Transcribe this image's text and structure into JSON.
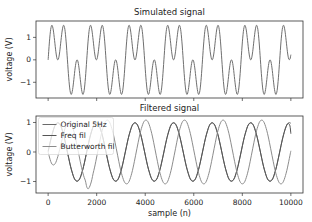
{
  "figure": {
    "ylabel_top": "voltage (V)",
    "ylabel_bottom": "voltage (V)",
    "xlabel": "sample (n)"
  },
  "chart_data": [
    {
      "type": "line",
      "title": "Simulated signal",
      "xlabel": "",
      "ylabel": "voltage (V)",
      "xlim": [
        -500,
        10500
      ],
      "ylim": [
        -1.7,
        1.73
      ],
      "xticks": [
        0,
        2000,
        4000,
        6000,
        8000,
        10000
      ],
      "xtick_labels_visible": false,
      "yticks": [
        -1,
        0,
        1
      ],
      "ytick_labels": [
        "−1",
        "0",
        "1"
      ],
      "grid": false,
      "legend": null,
      "x_start": 0,
      "x_step": 53,
      "x_end": 10000,
      "series": [
        {
          "name": "Simulated signal",
          "color": "#6f6f6f",
          "values": [
            0.0,
            0.8,
            1.36,
            1.54,
            1.33,
            0.87,
            0.36,
            0.04,
            0.04,
            0.36,
            0.87,
            1.33,
            1.54,
            1.36,
            0.8,
            0.0,
            -0.8,
            -1.36,
            -1.54,
            -1.33,
            -0.87,
            -0.36,
            -0.04,
            -0.04,
            -0.36,
            -0.87,
            -1.33,
            -1.54,
            -1.36,
            -0.8,
            0.0,
            0.8,
            1.36,
            1.54,
            1.33,
            0.87,
            0.36,
            0.04,
            0.04,
            0.36,
            0.87,
            1.33,
            1.54,
            1.36,
            0.8,
            0.0,
            -0.8,
            -1.36,
            -1.54,
            -1.33,
            -0.87,
            -0.36,
            -0.04,
            -0.04,
            -0.36,
            -0.87,
            -1.33,
            -1.54,
            -1.36,
            -0.8,
            0.0,
            0.8,
            1.36,
            1.54,
            1.33,
            0.87,
            0.36,
            0.04,
            0.04,
            0.36,
            0.87,
            1.33,
            1.54,
            1.36,
            0.8,
            0.0,
            -0.8,
            -1.36,
            -1.54,
            -1.33,
            -0.87,
            -0.36,
            -0.04,
            -0.04,
            -0.36,
            -0.87,
            -1.33,
            -1.54,
            -1.36,
            -0.8,
            0.0,
            0.8,
            1.36,
            1.54,
            1.33,
            0.87,
            0.36,
            0.04,
            0.04,
            0.36,
            0.87,
            1.33,
            1.54,
            1.36,
            0.8,
            0.0,
            -0.8,
            -1.36,
            -1.54,
            -1.33,
            -0.87,
            -0.36,
            -0.04,
            -0.04,
            -0.36,
            -0.87,
            -1.33,
            -1.54,
            -1.36,
            -0.8,
            0.0,
            0.8,
            1.36,
            1.54,
            1.33,
            0.87,
            0.36,
            0.04,
            0.04,
            0.36,
            0.87,
            1.33,
            1.54,
            1.36,
            0.8,
            0.0,
            -0.8,
            -1.36,
            -1.54,
            -1.33,
            -0.87,
            -0.36,
            -0.04,
            -0.04,
            -0.36,
            -0.87,
            -1.33,
            -1.54,
            -1.36,
            -0.8,
            0.0,
            0.8,
            1.36,
            1.54,
            1.33,
            0.87,
            0.36,
            0.04,
            0.04,
            0.36,
            0.87,
            1.33,
            1.54,
            1.36,
            0.8,
            0.0,
            -0.8,
            -1.36,
            -1.54,
            -1.33,
            -0.87,
            -0.36,
            -0.04,
            -0.04,
            -0.36,
            -0.87,
            -1.33,
            -1.54,
            -1.36,
            -0.8,
            0.0,
            0.8,
            1.36,
            1.54,
            1.33,
            0.87,
            0.36,
            0.04,
            0.04
          ],
          "final_value": 0.23
        }
      ]
    },
    {
      "type": "line",
      "title": "Filtered signal",
      "xlabel": "sample (n)",
      "ylabel": "voltage (V)",
      "xlim": [
        -500,
        10500
      ],
      "ylim": [
        -1.39,
        1.22
      ],
      "xticks": [
        0,
        2000,
        4000,
        6000,
        8000,
        10000
      ],
      "xtick_labels": [
        "0",
        "2000",
        "4000",
        "6000",
        "8000",
        "10000"
      ],
      "xtick_labels_visible": true,
      "yticks": [
        -1,
        0,
        1
      ],
      "ytick_labels": [
        "−1",
        "0",
        "1"
      ],
      "grid": false,
      "legend": "top-left",
      "x_start": 0,
      "x_step": 53,
      "x_end": 10000,
      "series": [
        {
          "name": "Original 5Hz",
          "color": "#6a6a6a",
          "values": [
            0,
            0.21,
            0.41,
            0.59,
            0.74,
            0.87,
            0.95,
            0.99,
            0.99,
            0.95,
            0.87,
            0.74,
            0.59,
            0.41,
            0.21,
            0,
            -0.21,
            -0.41,
            -0.59,
            -0.74,
            -0.87,
            -0.95,
            -0.99,
            -0.99,
            -0.95,
            -0.87,
            -0.74,
            -0.59,
            -0.41,
            -0.21,
            0,
            0.21,
            0.41,
            0.59,
            0.74,
            0.87,
            0.95,
            0.99,
            0.99,
            0.95,
            0.87,
            0.74,
            0.59,
            0.41,
            0.21,
            0,
            -0.21,
            -0.41,
            -0.59,
            -0.74,
            -0.87,
            -0.95,
            -0.99,
            -0.99,
            -0.95,
            -0.87,
            -0.74,
            -0.59,
            -0.41,
            -0.21,
            0,
            0.21,
            0.41,
            0.59,
            0.74,
            0.87,
            0.95,
            0.99,
            0.99,
            0.95,
            0.87,
            0.74,
            0.59,
            0.41,
            0.21,
            0,
            -0.21,
            -0.41,
            -0.59,
            -0.74,
            -0.87,
            -0.95,
            -0.99,
            -0.99,
            -0.95,
            -0.87,
            -0.74,
            -0.59,
            -0.41,
            -0.21,
            0,
            0.21,
            0.41,
            0.59,
            0.74,
            0.87,
            0.95,
            0.99,
            0.99,
            0.95,
            0.87,
            0.74,
            0.59,
            0.41,
            0.21,
            0,
            -0.21,
            -0.41,
            -0.59,
            -0.74,
            -0.87,
            -0.95,
            -0.99,
            -0.99,
            -0.95,
            -0.87,
            -0.74,
            -0.59,
            -0.41,
            -0.21,
            0,
            0.21,
            0.41,
            0.59,
            0.74,
            0.87,
            0.95,
            0.99,
            0.99,
            0.95,
            0.87,
            0.74,
            0.59,
            0.41,
            0.21,
            0,
            -0.21,
            -0.41,
            -0.59,
            -0.74,
            -0.87,
            -0.95,
            -0.99,
            -0.99,
            -0.95,
            -0.87,
            -0.74,
            -0.59,
            -0.41,
            -0.21,
            0,
            0.21,
            0.41,
            0.59,
            0.74,
            0.87,
            0.95,
            0.99,
            0.99,
            0.95,
            0.87,
            0.74,
            0.59,
            0.41,
            0.21,
            0,
            -0.21,
            -0.41,
            -0.59,
            -0.74,
            -0.87,
            -0.95,
            -0.99,
            -0.99,
            -0.95,
            -0.87,
            -0.74,
            -0.59,
            -0.41,
            -0.21,
            0,
            0.21,
            0.41,
            0.59,
            0.74,
            0.87,
            0.95,
            0.99,
            0.99
          ],
          "final_value": 0.97
        },
        {
          "name": "Freq fil",
          "color": "#555555",
          "values": [
            0.03,
            0.22,
            0.41,
            0.58,
            0.73,
            0.86,
            0.94,
            0.98,
            0.98,
            0.94,
            0.86,
            0.73,
            0.58,
            0.4,
            0.2,
            -0.01,
            -0.21,
            -0.41,
            -0.58,
            -0.73,
            -0.86,
            -0.94,
            -0.98,
            -0.98,
            -0.94,
            -0.86,
            -0.73,
            -0.58,
            -0.4,
            -0.2,
            0.01,
            0.21,
            0.41,
            0.58,
            0.73,
            0.86,
            0.94,
            0.98,
            0.98,
            0.94,
            0.86,
            0.73,
            0.58,
            0.4,
            0.2,
            0,
            -0.21,
            -0.41,
            -0.58,
            -0.73,
            -0.86,
            -0.94,
            -0.98,
            -0.98,
            -0.94,
            -0.86,
            -0.73,
            -0.58,
            -0.4,
            -0.2,
            0,
            0.21,
            0.41,
            0.58,
            0.73,
            0.86,
            0.94,
            0.98,
            0.98,
            0.94,
            0.86,
            0.73,
            0.58,
            0.4,
            0.2,
            0,
            -0.21,
            -0.41,
            -0.58,
            -0.73,
            -0.86,
            -0.94,
            -0.98,
            -0.98,
            -0.94,
            -0.86,
            -0.73,
            -0.58,
            -0.4,
            -0.2,
            0,
            0.21,
            0.41,
            0.58,
            0.73,
            0.86,
            0.94,
            0.98,
            0.98,
            0.94,
            0.86,
            0.73,
            0.58,
            0.4,
            0.2,
            0,
            -0.21,
            -0.41,
            -0.58,
            -0.73,
            -0.86,
            -0.94,
            -0.98,
            -0.98,
            -0.94,
            -0.86,
            -0.73,
            -0.58,
            -0.4,
            -0.2,
            0,
            0.21,
            0.41,
            0.58,
            0.73,
            0.86,
            0.94,
            0.98,
            0.98,
            0.94,
            0.86,
            0.73,
            0.58,
            0.4,
            0.2,
            0,
            -0.21,
            -0.41,
            -0.58,
            -0.73,
            -0.86,
            -0.94,
            -0.98,
            -0.98,
            -0.94,
            -0.86,
            -0.73,
            -0.58,
            -0.4,
            -0.2,
            0,
            0.21,
            0.41,
            0.58,
            0.73,
            0.86,
            0.94,
            0.98,
            0.98,
            0.94,
            0.86,
            0.73,
            0.58,
            0.4,
            0.2,
            0,
            -0.21,
            -0.41,
            -0.58,
            -0.73,
            -0.86,
            -0.94,
            -0.98,
            -0.98,
            -0.94,
            -0.86,
            -0.73,
            -0.58,
            -0.4,
            -0.2,
            0,
            0.21,
            0.41,
            0.58,
            0.74,
            0.86,
            0.95,
            0.96,
            0.88
          ],
          "final_value": 0.62
        },
        {
          "name": "Butterworth fil",
          "color": "#8c8c8c",
          "values": [
            0.0,
            -0.17,
            -0.32,
            -0.41,
            -0.44,
            -0.42,
            -0.35,
            -0.23,
            -0.08,
            0.09,
            0.27,
            0.46,
            0.63,
            0.78,
            0.91,
            0.98,
            1.02,
            1.01,
            0.95,
            0.84,
            0.7,
            0.53,
            0.32,
            0.11,
            -0.11,
            -0.33,
            -0.53,
            -0.71,
            -0.86,
            -0.98,
            -1.18,
            -1.25,
            -1.2,
            -1.09,
            -0.93,
            -0.72,
            -0.54,
            -0.33,
            -0.11,
            0.11,
            0.33,
            0.54,
            0.72,
            0.87,
            0.99,
            1.06,
            1.08,
            1.06,
            0.99,
            0.87,
            0.72,
            0.54,
            0.33,
            0.11,
            -0.11,
            -0.33,
            -0.54,
            -0.72,
            -0.87,
            -0.99,
            -1.06,
            -1.08,
            -1.06,
            -0.99,
            -0.87,
            -0.72,
            -0.54,
            -0.33,
            -0.11,
            0.11,
            0.33,
            0.54,
            0.72,
            0.87,
            0.99,
            1.06,
            1.08,
            1.06,
            0.99,
            0.87,
            0.72,
            0.54,
            0.33,
            0.11,
            -0.11,
            -0.33,
            -0.54,
            -0.72,
            -0.87,
            -0.99,
            -1.06,
            -1.08,
            -1.06,
            -0.99,
            -0.87,
            -0.72,
            -0.54,
            -0.33,
            -0.11,
            0.11,
            0.33,
            0.54,
            0.72,
            0.87,
            0.99,
            1.06,
            1.08,
            1.06,
            0.99,
            0.87,
            0.72,
            0.54,
            0.33,
            0.11,
            -0.11,
            -0.33,
            -0.54,
            -0.72,
            -0.87,
            -0.99,
            -1.06,
            -1.08,
            -1.06,
            -0.99,
            -0.87,
            -0.72,
            -0.54,
            -0.33,
            -0.11,
            0.11,
            0.33,
            0.54,
            0.72,
            0.87,
            0.99,
            1.06,
            1.08,
            1.06,
            0.99,
            0.87,
            0.72,
            0.54,
            0.33,
            0.11,
            -0.11,
            -0.33,
            -0.54,
            -0.72,
            -0.87,
            -0.99,
            -1.06,
            -1.08,
            -1.06,
            -0.99,
            -0.87,
            -0.72,
            -0.54,
            -0.33,
            -0.11,
            0.11,
            0.33,
            0.54,
            0.72,
            0.87,
            0.99,
            1.06,
            1.08,
            1.06,
            0.99,
            0.87,
            0.72,
            0.54,
            0.33,
            0.11,
            -0.11,
            -0.33,
            -0.54,
            -0.72,
            -0.87,
            -0.99,
            -1.06,
            -1.08,
            -1.06,
            -0.99,
            -0.87,
            -0.72,
            -0.54,
            -0.33,
            -0.11
          ],
          "final_value": 0.04
        }
      ]
    }
  ]
}
